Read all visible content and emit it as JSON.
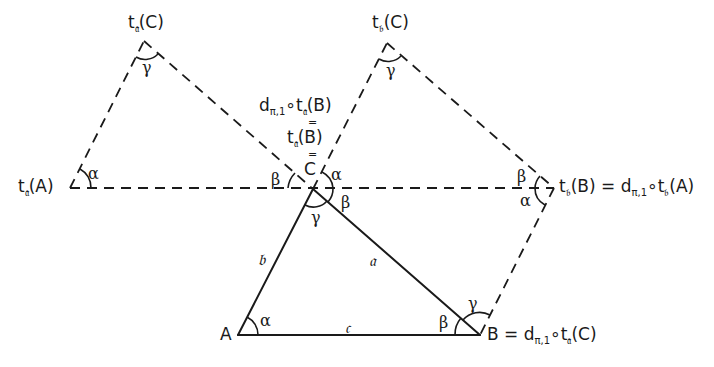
{
  "diagram": {
    "type": "geometry",
    "colors": {
      "stroke": "#1a1a1a",
      "background": "#ffffff"
    },
    "points": {
      "A": {
        "label": "A",
        "x": 238,
        "y": 335
      },
      "B": {
        "label": "B = d",
        "label_sub": "π,1",
        "label_rest": "∘t",
        "label_sub2": "𝔞",
        "label_tail": "(C)",
        "x": 480,
        "y": 335
      },
      "C": {
        "label": "C",
        "x": 313,
        "y": 189
      },
      "ta_A": {
        "label": "t",
        "sub": "𝔞",
        "tail": "(A)",
        "x": 70,
        "y": 188
      },
      "ta_C": {
        "label": "t",
        "sub": "𝔞",
        "tail": "(C)",
        "x": 144,
        "y": 41
      },
      "tb_C": {
        "label": "t",
        "sub": "𝔟",
        "tail": "(C)",
        "x": 387,
        "y": 43
      },
      "tb_B": {
        "label": "t",
        "sub": "𝔟",
        "tail": "(B) = d",
        "sub2": "π,1",
        "mid": "∘t",
        "sub3": "𝔟",
        "end": "(A)",
        "x": 554,
        "y": 188
      }
    },
    "c_stack": {
      "line1_pre": "d",
      "line1_sub": "π,1",
      "line1_mid": "∘t",
      "line1_sub2": "𝔞",
      "line1_tail": "(B)",
      "eq": "=",
      "line2_pre": "t",
      "line2_sub": "𝔞",
      "line2_tail": "(B)",
      "line3": "C"
    },
    "sides": {
      "a": "𝔞",
      "b": "𝔟",
      "c": "𝔠"
    },
    "angles": {
      "alpha": "α",
      "beta": "β",
      "gamma": "γ"
    },
    "solid_segments": [
      [
        "A",
        "B"
      ],
      [
        "A",
        "C"
      ],
      [
        "C",
        "B"
      ]
    ],
    "dashed_segments": [
      [
        "ta_A",
        "ta_C"
      ],
      [
        "ta_C",
        "C"
      ],
      [
        "ta_A",
        "tb_B"
      ],
      [
        "C",
        "tb_C"
      ],
      [
        "tb_C",
        "tb_B"
      ],
      [
        "tb_B",
        "B"
      ]
    ]
  }
}
